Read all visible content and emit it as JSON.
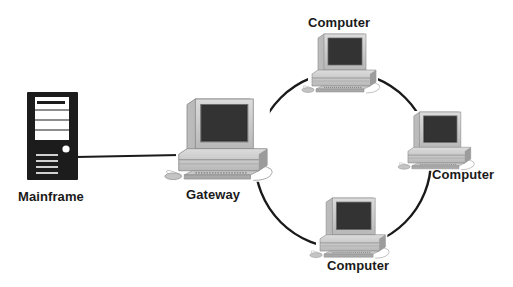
{
  "diagram": {
    "type": "network-topology",
    "topology": "ring with gateway to mainframe",
    "colors": {
      "background": "#ffffff",
      "line": "#1a1a1a",
      "mainframe": "#1c1c1c",
      "computer_case": "#cfcfcf",
      "screen": "#2a2a2a"
    },
    "nodes": [
      {
        "id": "mainframe",
        "label": "Mainframe",
        "icon": "mainframe-tower-icon"
      },
      {
        "id": "gateway",
        "label": "Gateway",
        "icon": "desktop-computer-icon"
      },
      {
        "id": "computer-top",
        "label": "Computer",
        "icon": "desktop-computer-icon"
      },
      {
        "id": "computer-right",
        "label": "Computer",
        "icon": "desktop-computer-icon"
      },
      {
        "id": "computer-bottom",
        "label": "Computer",
        "icon": "desktop-computer-icon"
      }
    ],
    "edges": [
      {
        "from": "mainframe",
        "to": "gateway",
        "style": "straight-line"
      },
      {
        "from": "gateway",
        "to": "computer-top",
        "style": "ring-arc"
      },
      {
        "from": "computer-top",
        "to": "computer-right",
        "style": "ring-arc"
      },
      {
        "from": "computer-right",
        "to": "computer-bottom",
        "style": "ring-arc"
      },
      {
        "from": "computer-bottom",
        "to": "gateway",
        "style": "ring-arc"
      }
    ]
  }
}
